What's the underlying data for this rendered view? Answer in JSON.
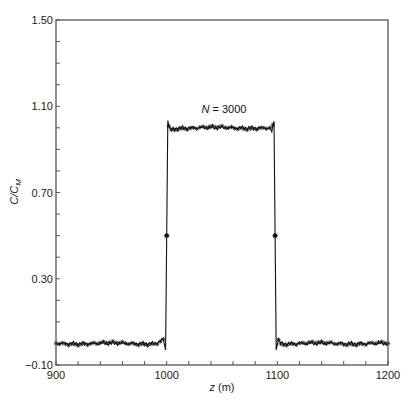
{
  "chart_data": {
    "type": "line",
    "title": "",
    "xlabel": "z (m)",
    "xlabel_var": "z",
    "xlabel_unit": "(m)",
    "ylabel": "C/C_M",
    "xlim": [
      900,
      1200
    ],
    "ylim": [
      -0.1,
      1.5
    ],
    "x_major_ticks": [
      900,
      1000,
      1100,
      1200
    ],
    "x_tick_labels": [
      "900",
      "1000",
      "1100",
      "1200"
    ],
    "x_minor_step": 20,
    "y_major_ticks": [
      -0.1,
      0.3,
      0.7,
      1.1,
      1.5
    ],
    "y_tick_labels": [
      "−0.10",
      "0.30",
      "0.70",
      "1.10",
      "1.50"
    ],
    "y_minor_step": 0.1,
    "grid": false,
    "legend": null,
    "annotations": [
      {
        "text_var": "N",
        "text_rest": " = 3000",
        "x": 1050,
        "y": 1.05
      }
    ],
    "series": [
      {
        "name": "N = 3000",
        "marker": "asterisk",
        "line": "solid",
        "description": "Square pulse: ~0 for z<1000, ~1.0 plateau from 1000 to 1100 with small oscillations and overshoot spikes (~1.03) at edges, ~0 for z>1100",
        "x": [
          900,
          910,
          920,
          930,
          940,
          950,
          960,
          970,
          980,
          990,
          997,
          999,
          1000,
          1001,
          1003,
          1010,
          1020,
          1030,
          1040,
          1050,
          1060,
          1070,
          1080,
          1090,
          1095,
          1097,
          1098,
          1099,
          1101,
          1103,
          1110,
          1120,
          1130,
          1140,
          1150,
          1160,
          1170,
          1180,
          1190,
          1200
        ],
        "y": [
          0.0,
          0.0,
          0.0,
          0.0,
          0.0,
          0.0,
          0.0,
          0.0,
          0.0,
          0.0,
          0.02,
          -0.03,
          0.5,
          1.03,
          0.99,
          1.0,
          1.0,
          1.0,
          1.0,
          1.0,
          1.0,
          1.0,
          1.0,
          1.0,
          0.99,
          1.03,
          0.5,
          -0.03,
          0.02,
          0.0,
          0.0,
          0.0,
          0.0,
          0.0,
          0.0,
          0.0,
          0.0,
          0.0,
          0.0,
          0.0
        ]
      }
    ]
  }
}
